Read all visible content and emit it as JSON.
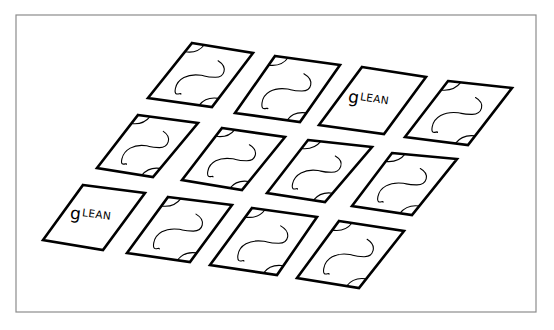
{
  "diagram": {
    "title": "",
    "canvas": {
      "width": 554,
      "height": 330,
      "background": "#ffffff"
    },
    "frame": {
      "x": 16,
      "y": 15,
      "width": 520,
      "height": 297,
      "stroke": "#8c8c8c"
    },
    "card_style": {
      "stroke": "#000000",
      "fill": "#ffffff"
    },
    "revealed_word": {
      "initial": "g",
      "rest": "LEAN",
      "full": "gLEAN"
    },
    "cards": [
      {
        "row": 1,
        "col": 1,
        "state": "face-down",
        "corners": [
          [
            192,
            43
          ],
          [
            253,
            53
          ],
          [
            212,
            107
          ],
          [
            148,
            98
          ]
        ]
      },
      {
        "row": 1,
        "col": 2,
        "state": "face-down",
        "corners": [
          [
            275,
            56
          ],
          [
            340,
            65
          ],
          [
            300,
            122
          ],
          [
            235,
            113
          ]
        ]
      },
      {
        "row": 1,
        "col": 3,
        "state": "face-up",
        "label": "gLEAN",
        "corners": [
          [
            362,
            67
          ],
          [
            426,
            77
          ],
          [
            384,
            134
          ],
          [
            319,
            125
          ]
        ]
      },
      {
        "row": 1,
        "col": 4,
        "state": "face-down",
        "corners": [
          [
            448,
            81
          ],
          [
            512,
            88
          ],
          [
            468,
            145
          ],
          [
            405,
            137
          ]
        ]
      },
      {
        "row": 2,
        "col": 1,
        "state": "face-down",
        "corners": [
          [
            138,
            115
          ],
          [
            198,
            123
          ],
          [
            153,
            177
          ],
          [
            97,
            168
          ]
        ]
      },
      {
        "row": 2,
        "col": 2,
        "state": "face-down",
        "corners": [
          [
            222,
            128
          ],
          [
            285,
            137
          ],
          [
            242,
            190
          ],
          [
            182,
            180
          ]
        ]
      },
      {
        "row": 2,
        "col": 3,
        "state": "face-down",
        "corners": [
          [
            308,
            140
          ],
          [
            372,
            147
          ],
          [
            325,
            202
          ],
          [
            267,
            193
          ]
        ]
      },
      {
        "row": 2,
        "col": 4,
        "state": "face-down",
        "corners": [
          [
            392,
            153
          ],
          [
            457,
            159
          ],
          [
            412,
            215
          ],
          [
            352,
            206
          ]
        ]
      },
      {
        "row": 3,
        "col": 1,
        "state": "face-up",
        "label": "gLEAN",
        "corners": [
          [
            83,
            185
          ],
          [
            145,
            193
          ],
          [
            103,
            250
          ],
          [
            43,
            240
          ]
        ]
      },
      {
        "row": 3,
        "col": 2,
        "state": "face-down",
        "corners": [
          [
            168,
            197
          ],
          [
            232,
            205
          ],
          [
            190,
            262
          ],
          [
            127,
            253
          ]
        ]
      },
      {
        "row": 3,
        "col": 3,
        "state": "face-down",
        "corners": [
          [
            252,
            208
          ],
          [
            317,
            217
          ],
          [
            277,
            275
          ],
          [
            210,
            265
          ]
        ]
      },
      {
        "row": 3,
        "col": 4,
        "state": "face-down",
        "corners": [
          [
            339,
            221
          ],
          [
            404,
            231
          ],
          [
            359,
            288
          ],
          [
            297,
            278
          ]
        ]
      }
    ],
    "face_down_pattern": {
      "elements": [
        "top-left corner arc",
        "bottom-right corner arc",
        "S-shaped squiggle in center"
      ]
    }
  }
}
